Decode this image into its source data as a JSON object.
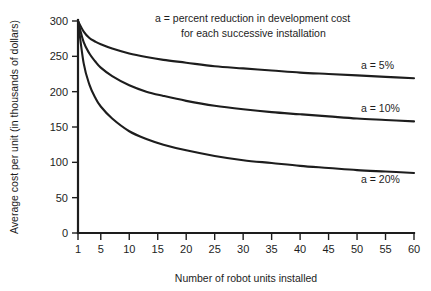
{
  "chart_data": {
    "type": "line",
    "title": "",
    "xlabel": "Number of robot units installed",
    "ylabel": "Average cost per unit (in thousands of dollars)",
    "xlim": [
      1,
      60
    ],
    "ylim": [
      0,
      300
    ],
    "grid": false,
    "legend_position": "right-inline",
    "xticks": [
      1,
      5,
      10,
      15,
      20,
      25,
      30,
      35,
      40,
      45,
      50,
      55,
      60
    ],
    "xtick_labels": [
      "1",
      "5",
      "10",
      "15",
      "20",
      "25",
      "30",
      "35",
      "40",
      "45",
      "50",
      "55",
      "60"
    ],
    "yticks": [
      0,
      50,
      100,
      150,
      200,
      250,
      300
    ],
    "ytick_labels": [
      "0",
      "50",
      "100",
      "150",
      "200",
      "250",
      "300"
    ],
    "annotations": [
      "a  =  percent reduction in development cost",
      "for each successive installation"
    ],
    "series": [
      {
        "name": "a = 5%",
        "label": "a =  5%",
        "x": [
          1,
          2,
          3,
          4,
          5,
          7,
          10,
          13,
          16,
          20,
          25,
          30,
          35,
          40,
          45,
          50,
          55,
          60
        ],
        "values": [
          300,
          285,
          276,
          271,
          267,
          261,
          254,
          249,
          245,
          241,
          236,
          233,
          230,
          227,
          225,
          223,
          221,
          219
        ]
      },
      {
        "name": "a = 10%",
        "label": "a = 10%",
        "x": [
          1,
          2,
          3,
          4,
          5,
          7,
          10,
          13,
          16,
          20,
          25,
          30,
          35,
          40,
          45,
          50,
          55,
          60
        ],
        "values": [
          300,
          270,
          254,
          243,
          234,
          222,
          209,
          200,
          194,
          187,
          180,
          175,
          171,
          168,
          165,
          162,
          160,
          158
        ]
      },
      {
        "name": "a = 20%",
        "label": "a = 20%",
        "x": [
          1,
          2,
          3,
          4,
          5,
          7,
          10,
          13,
          16,
          20,
          25,
          30,
          35,
          40,
          45,
          50,
          55,
          60
        ],
        "values": [
          300,
          240,
          210,
          192,
          179,
          162,
          144,
          133,
          125,
          117,
          109,
          103,
          99,
          95,
          92,
          89,
          87,
          85
        ]
      }
    ]
  },
  "colors": {
    "ink": "#1d1d1d",
    "background": "#ffffff"
  }
}
